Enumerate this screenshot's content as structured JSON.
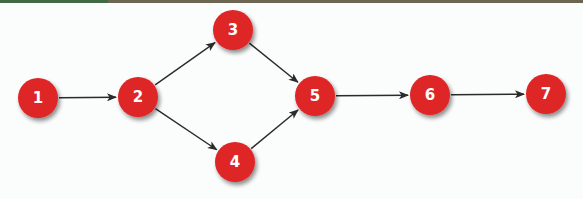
{
  "colors": {
    "node_fill": "#df2526",
    "node_shadow": "#9a9a9a",
    "node_text": "#ffffff",
    "edge": "#2b2b2b",
    "band_left": "#3f6a45",
    "band_right": "#6b6552",
    "background": "#fbfcfc"
  },
  "nodes": [
    {
      "id": "1",
      "label": "1",
      "x": 38,
      "y": 98
    },
    {
      "id": "2",
      "label": "2",
      "x": 138,
      "y": 97
    },
    {
      "id": "3",
      "label": "3",
      "x": 233,
      "y": 30
    },
    {
      "id": "4",
      "label": "4",
      "x": 235,
      "y": 162
    },
    {
      "id": "5",
      "label": "5",
      "x": 315,
      "y": 96
    },
    {
      "id": "6",
      "label": "6",
      "x": 430,
      "y": 95
    },
    {
      "id": "7",
      "label": "7",
      "x": 546,
      "y": 94
    }
  ],
  "edges": [
    {
      "from": "1",
      "to": "2"
    },
    {
      "from": "2",
      "to": "3"
    },
    {
      "from": "2",
      "to": "4"
    },
    {
      "from": "3",
      "to": "5"
    },
    {
      "from": "4",
      "to": "5"
    },
    {
      "from": "5",
      "to": "6"
    },
    {
      "from": "6",
      "to": "7"
    }
  ],
  "node_radius": 20
}
